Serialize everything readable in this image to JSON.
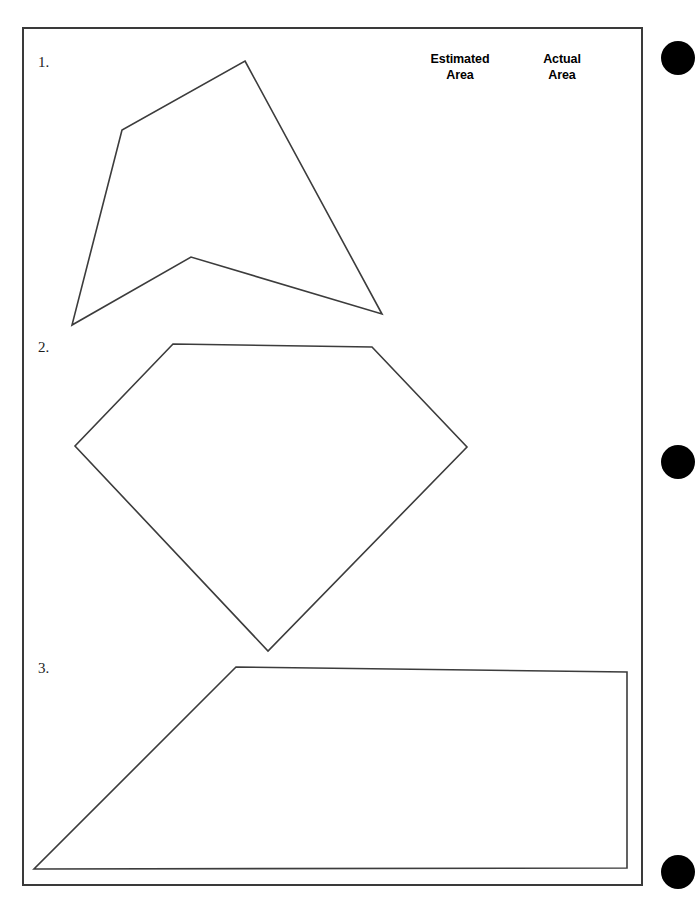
{
  "page": {
    "width": 678,
    "height": 901,
    "background_color": "#ffffff",
    "border_color": "#3a3a3a",
    "ink_color": "#3c3c3c"
  },
  "headers": {
    "estimated_area": {
      "line1": "Estimated",
      "line2": "Area"
    },
    "actual_area": {
      "line1": "Actual",
      "line2": "Area"
    }
  },
  "items": [
    {
      "number": "1.",
      "shape_name": "concave-pentagon-arrowhead",
      "points": "245,61 382,314 191,257 72,325 122,130"
    },
    {
      "number": "2.",
      "shape_name": "pentagon-diamond",
      "points": "173,344 372,347 467,447 268,651 75,446"
    },
    {
      "number": "3.",
      "shape_name": "trapezoid",
      "points": "236,667 627,672 627,868 34,869"
    }
  ],
  "binder_holes": {
    "count": 3,
    "color": "#000000"
  }
}
